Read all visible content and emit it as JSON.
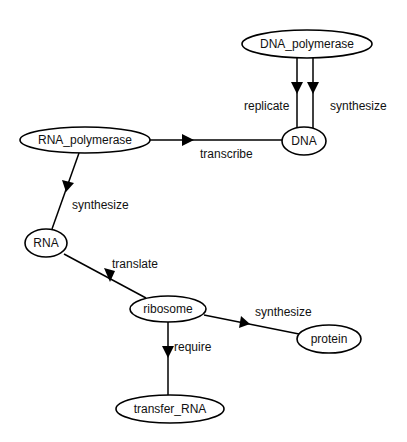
{
  "diagram": {
    "type": "directed-graph",
    "nodes": [
      {
        "id": "DNA_polymerase",
        "label": "DNA_polymerase"
      },
      {
        "id": "DNA",
        "label": "DNA"
      },
      {
        "id": "RNA_polymerase",
        "label": "RNA_polymerase"
      },
      {
        "id": "RNA",
        "label": "RNA"
      },
      {
        "id": "ribosome",
        "label": "ribosome"
      },
      {
        "id": "protein",
        "label": "protein"
      },
      {
        "id": "transfer_RNA",
        "label": "transfer_RNA"
      }
    ],
    "edges": [
      {
        "from": "DNA_polymerase",
        "to": "DNA",
        "label": "replicate"
      },
      {
        "from": "DNA_polymerase",
        "to": "DNA",
        "label": "synthesize"
      },
      {
        "from": "RNA_polymerase",
        "to": "DNA",
        "label": "transcribe"
      },
      {
        "from": "RNA_polymerase",
        "to": "RNA",
        "label": "synthesize"
      },
      {
        "from": "ribosome",
        "to": "RNA",
        "label": "translate"
      },
      {
        "from": "ribosome",
        "to": "protein",
        "label": "synthesize"
      },
      {
        "from": "ribosome",
        "to": "transfer_RNA",
        "label": "require"
      }
    ]
  }
}
